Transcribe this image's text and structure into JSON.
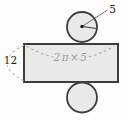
{
  "figure": {
    "type": "cylinder-net-diagram",
    "labels": {
      "radius": "5",
      "height": "12",
      "circumference": "2π×5"
    },
    "colors": {
      "background": "#fdfdfd",
      "shape_fill": "#e9e9e9",
      "shape_stroke": "#3d3d3d",
      "dash_stroke": "#b0b0b0",
      "dimension_text": "#222222",
      "circumference_text": "#9b9b9b"
    }
  }
}
